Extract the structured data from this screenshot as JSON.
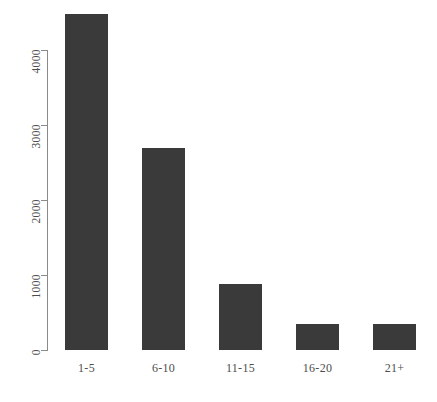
{
  "chart_data": {
    "type": "bar",
    "title": "",
    "subtitle": "",
    "xlabel": "",
    "ylabel": "",
    "categories": [
      "1-5",
      "6-10",
      "11-15",
      "16-20",
      "21+"
    ],
    "values": [
      1130,
      4480,
      2700,
      880,
      350
    ],
    "series": [
      {
        "name": "count",
        "values": [
          1130,
          4480,
          2700,
          880,
          350
        ]
      }
    ],
    "ylim": [
      0,
      4500
    ],
    "yticks": [
      0,
      1000,
      2000,
      3000,
      4000
    ],
    "ytick_labels": [
      "0",
      "1000",
      "2000",
      "3000",
      "4000"
    ],
    "ytick_label_rotation": 90,
    "xtick_labels": [
      "1-5",
      "6-10",
      "11-15",
      "16-20",
      "21+"
    ],
    "grid": false,
    "legend": false,
    "legend_position": "none",
    "bar_color": "#3a3a3a",
    "axis_color": "#8a8a8a",
    "tick_label_color": "#4d4d4d",
    "background_color": "#ffffff"
  }
}
